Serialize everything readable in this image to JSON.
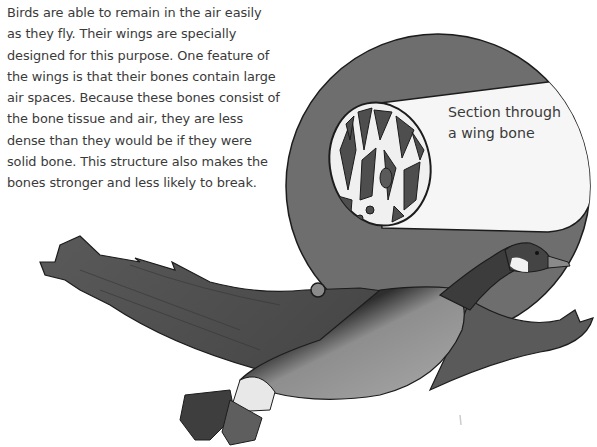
{
  "paragraph": {
    "lines": [
      "Birds are able to remain in the air easily",
      "as they fly. Their wings are specially",
      "designed for this purpose. One feature of",
      "the wings is that their bones contain large",
      "air spaces. Because these bones consist of",
      "the bone tissue and air, they are less",
      "dense than they would be if they were",
      "solid bone. This structure also makes the",
      "bones stronger and less likely to break."
    ]
  },
  "illustration": {
    "subject": "goose in flight with magnified wing bone",
    "callout_label": {
      "line1": "Section through",
      "line2": "a wing bone"
    },
    "colors": {
      "magnifier_circle": "#6e6e6e",
      "bone_outer": "#f4f4f4",
      "bone_cavity": "#555555",
      "goose_body": "#4a4a4a",
      "goose_chest": "#9a9a9a",
      "outline": "#1c1c1c"
    }
  }
}
